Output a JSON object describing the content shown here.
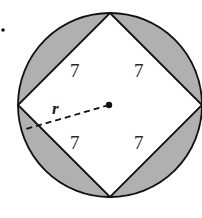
{
  "diagram": {
    "bullet": "•",
    "side_labels": [
      "7",
      "7",
      "7",
      "7"
    ],
    "radius_label": "r",
    "colors": {
      "shade": "#b0b0b0",
      "stroke": "#111111",
      "background": "#ffffff"
    }
  }
}
